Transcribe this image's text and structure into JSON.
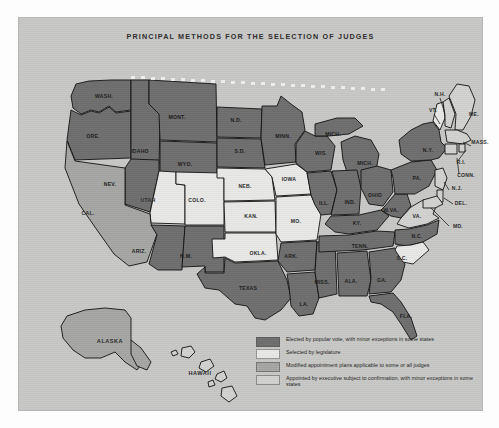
{
  "map": {
    "title": "PRINCIPAL METHODS FOR THE SELECTION OF JUDGES",
    "colors": {
      "elected": "#6f6f6f",
      "legislature": "#e8e8e6",
      "modified": "#a6a6a4",
      "executive": "#d2d2d0",
      "panel_background": "#c8c8c6",
      "outline": "#111111",
      "label_text": "#1b1b1b"
    },
    "legend": [
      {
        "key": "elected",
        "swatch": "#6f6f6f",
        "label": "Elected by popular vote, with minor exceptions in some states"
      },
      {
        "key": "legislature",
        "swatch": "#e8e8e6",
        "label": "Selected by legislature"
      },
      {
        "key": "modified",
        "swatch": "#a6a6a4",
        "label": "Modified appointment plans applicable to some or all judges"
      },
      {
        "key": "executive",
        "swatch": "#d2d2d0",
        "label": "Appointed by executive subject to confirmation, with minor exceptions in some states"
      }
    ],
    "states": [
      {
        "abbr": "WASH.",
        "x": 85,
        "y": 78,
        "category": "elected"
      },
      {
        "abbr": "ORE.",
        "x": 74,
        "y": 118,
        "category": "elected"
      },
      {
        "abbr": "IDAHO",
        "x": 121,
        "y": 133,
        "category": "elected"
      },
      {
        "abbr": "MONT.",
        "x": 158,
        "y": 99,
        "category": "elected"
      },
      {
        "abbr": "WYO.",
        "x": 166,
        "y": 146,
        "category": "elected"
      },
      {
        "abbr": "NEV.",
        "x": 91,
        "y": 166,
        "category": "elected"
      },
      {
        "abbr": "UTAH",
        "x": 129,
        "y": 182,
        "category": "legislature"
      },
      {
        "abbr": "CAL.",
        "x": 69,
        "y": 195,
        "category": "modified"
      },
      {
        "abbr": "ARIZ.",
        "x": 120,
        "y": 233,
        "category": "elected"
      },
      {
        "abbr": "N.M.",
        "x": 167,
        "y": 238,
        "category": "elected"
      },
      {
        "abbr": "COLO.",
        "x": 178,
        "y": 182,
        "category": "legislature"
      },
      {
        "abbr": "N.D.",
        "x": 217,
        "y": 102,
        "category": "elected"
      },
      {
        "abbr": "S.D.",
        "x": 221,
        "y": 133,
        "category": "elected"
      },
      {
        "abbr": "NEB.",
        "x": 226,
        "y": 168,
        "category": "legislature"
      },
      {
        "abbr": "KAN.",
        "x": 232,
        "y": 198,
        "category": "legislature"
      },
      {
        "abbr": "OKLA.",
        "x": 239,
        "y": 235,
        "category": "legislature"
      },
      {
        "abbr": "TEXAS",
        "x": 229,
        "y": 270,
        "category": "elected"
      },
      {
        "abbr": "MINN.",
        "x": 264,
        "y": 118,
        "category": "elected"
      },
      {
        "abbr": "IOWA",
        "x": 270,
        "y": 161,
        "category": "legislature"
      },
      {
        "abbr": "MO.",
        "x": 277,
        "y": 203,
        "category": "legislature"
      },
      {
        "abbr": "ARK.",
        "x": 272,
        "y": 238,
        "category": "elected"
      },
      {
        "abbr": "LA.",
        "x": 285,
        "y": 286,
        "category": "elected"
      },
      {
        "abbr": "WIS.",
        "x": 302,
        "y": 135,
        "category": "elected"
      },
      {
        "abbr": "ILL.",
        "x": 305,
        "y": 185,
        "category": "elected"
      },
      {
        "abbr": "MISS.",
        "x": 303,
        "y": 264,
        "category": "elected"
      },
      {
        "abbr": "MICH.",
        "x": 314,
        "y": 116,
        "category": "elected"
      },
      {
        "abbr": "MICH.",
        "x": 346,
        "y": 145,
        "category": "elected"
      },
      {
        "abbr": "IND.",
        "x": 331,
        "y": 184,
        "category": "elected"
      },
      {
        "abbr": "KY.",
        "x": 338,
        "y": 205,
        "category": "elected"
      },
      {
        "abbr": "TENN.",
        "x": 341,
        "y": 228,
        "category": "elected"
      },
      {
        "abbr": "ALA.",
        "x": 332,
        "y": 263,
        "category": "elected"
      },
      {
        "abbr": "GA.",
        "x": 363,
        "y": 262,
        "category": "elected"
      },
      {
        "abbr": "FLA.",
        "x": 387,
        "y": 298,
        "category": "elected"
      },
      {
        "abbr": "OHIO",
        "x": 356,
        "y": 177,
        "category": "elected"
      },
      {
        "abbr": "W.VA.",
        "x": 372,
        "y": 192,
        "category": "elected"
      },
      {
        "abbr": "VA.",
        "x": 398,
        "y": 198,
        "category": "elected"
      },
      {
        "abbr": "N.C.",
        "x": 398,
        "y": 218,
        "category": "elected"
      },
      {
        "abbr": "S.C.",
        "x": 383,
        "y": 240,
        "category": "legislature"
      },
      {
        "abbr": "PA.",
        "x": 398,
        "y": 160,
        "category": "elected"
      },
      {
        "abbr": "N.Y.",
        "x": 409,
        "y": 132,
        "category": "elected"
      },
      {
        "abbr": "VT.",
        "x": 414,
        "y": 92,
        "category": "legislature"
      },
      {
        "abbr": "N.H.",
        "x": 421,
        "y": 76,
        "category": "executive"
      },
      {
        "abbr": "ME.",
        "x": 455,
        "y": 96,
        "category": "executive"
      },
      {
        "abbr": "MASS.",
        "x": 461,
        "y": 124,
        "category": "executive"
      },
      {
        "abbr": "R.I.",
        "x": 442,
        "y": 144,
        "category": "executive"
      },
      {
        "abbr": "CONN.",
        "x": 447,
        "y": 157,
        "category": "executive"
      },
      {
        "abbr": "N.J.",
        "x": 438,
        "y": 170,
        "category": "executive"
      },
      {
        "abbr": "DEL.",
        "x": 442,
        "y": 185,
        "category": "executive"
      },
      {
        "abbr": "MD.",
        "x": 439,
        "y": 208,
        "category": "executive"
      },
      {
        "abbr": "ALASKA",
        "x": 91,
        "y": 323,
        "category": "modified"
      },
      {
        "abbr": "HAWAII",
        "x": 181,
        "y": 355,
        "category": "executive"
      }
    ]
  }
}
